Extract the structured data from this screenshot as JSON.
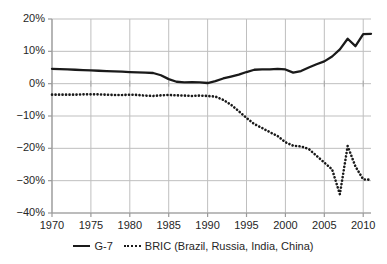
{
  "chart_data": {
    "type": "line",
    "title": "",
    "subtitle": "",
    "xlabel": "",
    "ylabel": "",
    "xlim": [
      1970,
      2011
    ],
    "ylim": [
      -40,
      20
    ],
    "grid": true,
    "y_tick_labels": [
      "20%",
      "10%",
      "0%",
      "-10%",
      "-20%",
      "-30%",
      "-40%"
    ],
    "y_tick_values": [
      20,
      10,
      0,
      -10,
      -20,
      -30,
      -40
    ],
    "x_tick_labels": [
      "1970",
      "1975",
      "1980",
      "1985",
      "1990",
      "1995",
      "2000",
      "2005",
      "2010"
    ],
    "x_tick_values": [
      1970,
      1975,
      1980,
      1985,
      1990,
      1995,
      2000,
      2005,
      2010
    ],
    "legend_position": "bottom",
    "x": [
      1970,
      1971,
      1972,
      1973,
      1974,
      1975,
      1976,
      1977,
      1978,
      1979,
      1980,
      1981,
      1982,
      1983,
      1984,
      1985,
      1986,
      1987,
      1988,
      1989,
      1990,
      1991,
      1992,
      1993,
      1994,
      1995,
      1996,
      1997,
      1998,
      1999,
      2000,
      2001,
      2002,
      2003,
      2004,
      2005,
      2006,
      2007,
      2008,
      2009,
      2010,
      2011
    ],
    "series": [
      {
        "name": "G-7",
        "style": "solid",
        "color": "#1a1a1a",
        "values": [
          4.6,
          4.5,
          4.4,
          4.3,
          4.2,
          4.1,
          4.0,
          3.9,
          3.8,
          3.7,
          3.6,
          3.5,
          3.4,
          3.3,
          2.6,
          1.4,
          0.6,
          0.4,
          0.5,
          0.4,
          0.2,
          0.8,
          1.6,
          2.2,
          2.8,
          3.6,
          4.3,
          4.4,
          4.4,
          4.6,
          4.4,
          3.4,
          3.9,
          5.0,
          6.0,
          6.9,
          8.4,
          10.6,
          13.9,
          11.6,
          15.3,
          15.4
        ]
      },
      {
        "name": "BRIC (Brazil, Russia, India, China)",
        "style": "dotted",
        "color": "#1a1a1a",
        "values": [
          -3.4,
          -3.4,
          -3.4,
          -3.4,
          -3.3,
          -3.3,
          -3.3,
          -3.4,
          -3.5,
          -3.5,
          -3.4,
          -3.5,
          -3.7,
          -3.8,
          -3.6,
          -3.5,
          -3.6,
          -3.7,
          -3.8,
          -3.7,
          -3.8,
          -4.0,
          -5.0,
          -6.5,
          -8.5,
          -10.6,
          -12.5,
          -13.7,
          -15.0,
          -16.2,
          -18.1,
          -19.2,
          -19.4,
          -20.2,
          -22.3,
          -24.4,
          -26.5,
          -34.2,
          -19.3,
          -25.6,
          -29.6,
          -29.7
        ]
      }
    ]
  },
  "legend": {
    "items": [
      {
        "label": "G-7",
        "style": "solid"
      },
      {
        "label": "BRIC (Brazil, Russia, India, China)",
        "style": "dotted"
      }
    ]
  }
}
